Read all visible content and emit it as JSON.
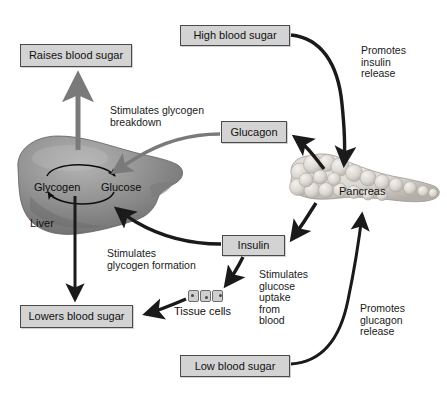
{
  "diagram": {
    "colors": {
      "box_fill": "#d3d3d3",
      "box_border": "#4a4a4a",
      "arrow_dark": "#1a1a1a",
      "arrow_gray": "#6b6b6b",
      "liver_fill": "#8c8c8c",
      "pancreas_fill": "#d8d5d0",
      "text": "#111111"
    },
    "boxes": [
      {
        "id": "high-blood-sugar",
        "label": "High blood sugar",
        "x": 180,
        "y": 25,
        "w": 110,
        "h": 21
      },
      {
        "id": "raises-blood-sugar",
        "label": "Raises blood sugar",
        "x": 20,
        "y": 44,
        "w": 112,
        "h": 23
      },
      {
        "id": "glucagon",
        "label": "Glucagon",
        "x": 221,
        "y": 121,
        "w": 66,
        "h": 22
      },
      {
        "id": "insulin",
        "label": "Insulin",
        "x": 222,
        "y": 235,
        "w": 63,
        "h": 21
      },
      {
        "id": "lowers-blood-sugar",
        "label": "Lowers blood sugar",
        "x": 20,
        "y": 305,
        "w": 113,
        "h": 23
      },
      {
        "id": "low-blood-sugar",
        "label": "Low blood sugar",
        "x": 180,
        "y": 355,
        "w": 110,
        "h": 22
      }
    ],
    "captions": [
      {
        "id": "promotes-insulin-release",
        "text": "Promotes\ninsulin\nrelease",
        "x": 361,
        "y": 45
      },
      {
        "id": "stimulates-glycogen-breakdown",
        "text": "Stimulates glycogen\nbreakdown",
        "x": 110,
        "y": 105
      },
      {
        "id": "stimulates-glycogen-formation",
        "text": "Stimulates\nglycogen formation",
        "x": 107,
        "y": 248
      },
      {
        "id": "stimulates-glucose-uptake",
        "text": "Stimulates\nglucose\nuptake\nfrom\nblood",
        "x": 259,
        "y": 269
      },
      {
        "id": "promotes-glucagon-release",
        "text": "Promotes\nglucagon\nrelease",
        "x": 360,
        "y": 303
      }
    ],
    "organ_labels": [
      {
        "id": "liver-label",
        "text": "Liver",
        "x": 30,
        "y": 218
      },
      {
        "id": "pancreas-label",
        "text": "Pancreas",
        "x": 339,
        "y": 186
      },
      {
        "id": "tissue-cells-label",
        "text": "Tissue cells",
        "x": 174,
        "y": 306
      }
    ],
    "cycle_labels": [
      {
        "id": "glycogen-label",
        "text": "Glycogen",
        "x": 34,
        "y": 182
      },
      {
        "id": "glucose-label",
        "text": "Glucose",
        "x": 101,
        "y": 182
      }
    ],
    "tissue_cells": {
      "x": 188,
      "y": 290,
      "count": 3
    },
    "edges": [
      {
        "id": "high-sugar-to-pancreas",
        "from": "high-blood-sugar",
        "to": "pancreas",
        "style": "dark-curve"
      },
      {
        "id": "pancreas-to-glucagon",
        "from": "pancreas",
        "to": "glucagon",
        "style": "dark-curve"
      },
      {
        "id": "pancreas-to-insulin",
        "from": "pancreas",
        "to": "insulin",
        "style": "dark-curve"
      },
      {
        "id": "glucagon-to-liver",
        "from": "glucagon",
        "to": "liver",
        "style": "gray-curve"
      },
      {
        "id": "insulin-to-liver",
        "from": "insulin",
        "to": "liver",
        "style": "dark-curve"
      },
      {
        "id": "insulin-to-tissue-cells",
        "from": "insulin",
        "to": "tissue-cells",
        "style": "dark-curve"
      },
      {
        "id": "liver-to-raises-sugar",
        "from": "liver",
        "to": "raises-blood-sugar",
        "style": "gray-arrow"
      },
      {
        "id": "liver-to-lowers-sugar",
        "from": "liver",
        "to": "lowers-blood-sugar",
        "style": "dark-arrow"
      },
      {
        "id": "tissue-cells-to-lowers",
        "from": "tissue-cells",
        "to": "lowers-blood-sugar",
        "style": "dark-curve"
      },
      {
        "id": "low-sugar-to-pancreas",
        "from": "low-blood-sugar",
        "to": "pancreas",
        "style": "dark-curve"
      },
      {
        "id": "glycogen-to-glucose",
        "from": "glycogen",
        "to": "glucose",
        "style": "thin-arc"
      },
      {
        "id": "glucose-to-glycogen",
        "from": "glucose",
        "to": "glycogen",
        "style": "thin-arc"
      }
    ]
  }
}
